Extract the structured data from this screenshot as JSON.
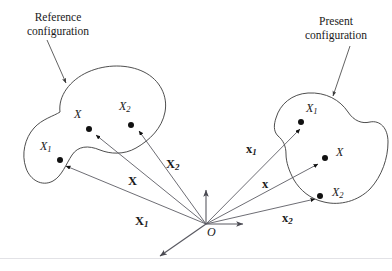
{
  "figure": {
    "type": "diagram",
    "background_color": "#ffffff",
    "stroke_color": "#3a3a3a",
    "text_color": "#1a1a1a",
    "width": 392,
    "height": 271
  },
  "callouts": {
    "reference": {
      "line1": "Reference",
      "line2": "configuration"
    },
    "present": {
      "line1": "Present",
      "line2": "configuration"
    }
  },
  "origin": {
    "label": "O"
  },
  "reference_body": {
    "points": [
      {
        "name": "X",
        "base": "X",
        "sub": ""
      },
      {
        "name": "X1",
        "base": "X",
        "sub": "1"
      },
      {
        "name": "X2",
        "base": "X",
        "sub": "2"
      }
    ]
  },
  "present_body": {
    "points": [
      {
        "name": "X",
        "base": "X",
        "sub": ""
      },
      {
        "name": "X1",
        "base": "X",
        "sub": "1"
      },
      {
        "name": "X2",
        "base": "X",
        "sub": "2"
      }
    ]
  },
  "reference_vectors": [
    {
      "name": "X",
      "base": "X",
      "sub": ""
    },
    {
      "name": "X1",
      "base": "X",
      "sub": "1"
    },
    {
      "name": "X2",
      "base": "X",
      "sub": "2"
    }
  ],
  "present_vectors": [
    {
      "name": "x",
      "base": "x",
      "sub": ""
    },
    {
      "name": "x1",
      "base": "x",
      "sub": "1"
    },
    {
      "name": "x2",
      "base": "x",
      "sub": "2"
    }
  ],
  "axes": {
    "count": 3,
    "directions": [
      "up",
      "right",
      "down-left"
    ]
  }
}
